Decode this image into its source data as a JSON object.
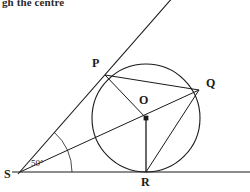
{
  "document": {
    "header_text": "gh the centre",
    "figure_type": "geometry-diagram",
    "description": "Circle with centre O, tangents from external point S touching at P and R, chords PQ, QR and radii OP, OQ, OR"
  },
  "figure": {
    "stroke_color": "#1a1a1a",
    "fill_color": "#ffffff",
    "background": "#ffffff",
    "labels": {
      "P": "P",
      "Q": "Q",
      "O": "O",
      "R": "R",
      "S": "S"
    },
    "angle": {
      "value": "50",
      "unit": "°",
      "text": "50°",
      "at_vertex": "S"
    },
    "points": {
      "O": {
        "x": 146,
        "y": 118
      },
      "P": {
        "x": 105,
        "y": 75
      },
      "Q": {
        "x": 199,
        "y": 90
      },
      "R": {
        "x": 146,
        "y": 172
      },
      "S": {
        "x": 20,
        "y": 172
      }
    },
    "circle": {
      "cx": 146,
      "cy": 118,
      "r": 54
    },
    "segments": [
      {
        "name": "tangent-S-to-P-extended",
        "from": "S",
        "to": "upper-right-edge"
      },
      {
        "name": "tangent-S-to-R-horizontal",
        "from": "S",
        "to": "right-edge"
      },
      {
        "name": "chord-P-Q",
        "from": "P",
        "to": "Q"
      },
      {
        "name": "radius-O-P",
        "from": "O",
        "to": "P"
      },
      {
        "name": "radius-O-Q",
        "from": "O",
        "to": "Q"
      },
      {
        "name": "radius-O-R",
        "from": "O",
        "to": "R"
      },
      {
        "name": "chord-Q-R",
        "from": "Q",
        "to": "R"
      },
      {
        "name": "line-S-through-O-to-Q",
        "from": "S",
        "to": "Q"
      }
    ]
  }
}
